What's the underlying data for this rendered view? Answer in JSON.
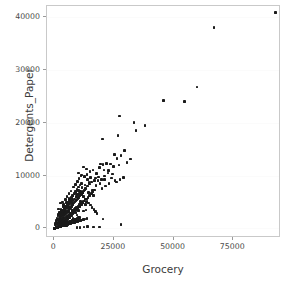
{
  "chart_data": {
    "type": "scatter",
    "title": "",
    "xlabel": "Grocery",
    "ylabel": "Detergents_Paper",
    "xlim": [
      -3000,
      95000
    ],
    "ylim": [
      -1800,
      42000
    ],
    "xticks": [
      0,
      25000,
      50000,
      75000
    ],
    "xticklabels": [
      "0",
      "25000",
      "50000",
      "75000"
    ],
    "yticks": [
      0,
      10000,
      20000,
      30000,
      40000
    ],
    "yticklabels": [
      "0",
      "10000",
      "20000",
      "30000",
      "40000"
    ],
    "grid": true,
    "legend": null,
    "marker_color": "#1a1a1a",
    "marker_size": 3,
    "n_points": 440,
    "points": [
      [
        12126,
        6707
      ],
      [
        6975,
        2919
      ],
      [
        7684,
        3516
      ],
      [
        5104,
        507
      ],
      [
        20484,
        1788
      ],
      [
        6369,
        2405
      ],
      [
        7198,
        5417
      ],
      [
        7684,
        4756
      ],
      [
        5008,
        1125
      ],
      [
        10159,
        5777
      ],
      [
        2182,
        1483
      ],
      [
        8953,
        1672
      ],
      [
        21042,
        9213
      ],
      [
        5570,
        2316
      ],
      [
        11559,
        8404
      ],
      [
        2796,
        1056
      ],
      [
        13507,
        5003
      ],
      [
        2085,
        465
      ],
      [
        13316,
        3471
      ],
      [
        3884,
        961
      ],
      [
        6157,
        5686
      ],
      [
        2483,
        371
      ],
      [
        9191,
        3055
      ],
      [
        16386,
        6210
      ],
      [
        8147,
        2906
      ],
      [
        6694,
        1000
      ],
      [
        9274,
        5963
      ],
      [
        3436,
        802
      ],
      [
        3232,
        750
      ],
      [
        3511,
        804
      ],
      [
        6207,
        3188
      ],
      [
        5047,
        1105
      ],
      [
        4396,
        3190
      ],
      [
        13178,
        4540
      ],
      [
        27329,
        21228
      ],
      [
        4948,
        1330
      ],
      [
        4318,
        640
      ],
      [
        6886,
        1345
      ],
      [
        10266,
        1567
      ],
      [
        3802,
        1130
      ],
      [
        2085,
        582
      ],
      [
        10072,
        3394
      ],
      [
        5256,
        1708
      ],
      [
        11011,
        5100
      ],
      [
        5613,
        1426
      ],
      [
        7812,
        1852
      ],
      [
        12352,
        3266
      ],
      [
        7684,
        3516
      ],
      [
        3042,
        696
      ],
      [
        5234,
        2140
      ],
      [
        9602,
        2550
      ],
      [
        5000,
        1300
      ],
      [
        6000,
        2300
      ],
      [
        4200,
        1500
      ],
      [
        7500,
        2900
      ],
      [
        3300,
        900
      ],
      [
        2400,
        600
      ],
      [
        8800,
        3800
      ],
      [
        5600,
        1900
      ],
      [
        10500,
        4600
      ],
      [
        12000,
        5200
      ],
      [
        14500,
        6800
      ],
      [
        9000,
        3500
      ],
      [
        6400,
        2200
      ],
      [
        4700,
        1400
      ],
      [
        3100,
        700
      ],
      [
        2200,
        480
      ],
      [
        1800,
        320
      ],
      [
        1500,
        260
      ],
      [
        1200,
        180
      ],
      [
        16000,
        7200
      ],
      [
        17500,
        8100
      ],
      [
        13200,
        5600
      ],
      [
        11800,
        4900
      ],
      [
        8400,
        3100
      ],
      [
        7100,
        2600
      ],
      [
        5900,
        2000
      ],
      [
        4500,
        1250
      ],
      [
        3600,
        880
      ],
      [
        2900,
        620
      ],
      [
        19500,
        12200
      ],
      [
        20500,
        12100
      ],
      [
        18900,
        11500
      ],
      [
        22000,
        12300
      ],
      [
        23500,
        12200
      ],
      [
        24800,
        11700
      ],
      [
        26300,
        13200
      ],
      [
        27100,
        12000
      ],
      [
        25200,
        14000
      ],
      [
        28000,
        13800
      ],
      [
        29500,
        14700
      ],
      [
        26800,
        17600
      ],
      [
        20200,
        16900
      ],
      [
        33500,
        20000
      ],
      [
        34200,
        18500
      ],
      [
        38000,
        19400
      ],
      [
        30500,
        12500
      ],
      [
        32000,
        13100
      ],
      [
        45800,
        24200
      ],
      [
        54500,
        24000
      ],
      [
        59800,
        26700
      ],
      [
        67000,
        37900
      ],
      [
        92780,
        40827
      ],
      [
        28000,
        800
      ],
      [
        19000,
        250
      ],
      [
        16500,
        300
      ],
      [
        14000,
        350
      ],
      [
        12500,
        260
      ],
      [
        10800,
        200
      ],
      [
        9500,
        180
      ],
      [
        1100,
        150
      ],
      [
        900,
        120
      ],
      [
        750,
        95
      ],
      [
        600,
        80
      ],
      [
        450,
        60
      ],
      [
        350,
        45
      ],
      [
        280,
        35
      ],
      [
        220,
        28
      ],
      [
        170,
        22
      ],
      [
        130,
        18
      ],
      [
        2600,
        4800
      ],
      [
        1900,
        3700
      ],
      [
        3400,
        5000
      ],
      [
        2000,
        450
      ],
      [
        2700,
        560
      ],
      [
        3900,
        1020
      ],
      [
        4400,
        1180
      ],
      [
        5100,
        1480
      ],
      [
        5800,
        1760
      ],
      [
        6500,
        2050
      ],
      [
        7200,
        2400
      ],
      [
        7900,
        2750
      ],
      [
        8600,
        3100
      ],
      [
        9300,
        3450
      ],
      [
        10000,
        3800
      ],
      [
        10700,
        4150
      ],
      [
        11400,
        4500
      ],
      [
        12100,
        4850
      ],
      [
        12800,
        5200
      ],
      [
        13500,
        5550
      ],
      [
        14200,
        5900
      ],
      [
        14900,
        6250
      ],
      [
        15600,
        6600
      ],
      [
        16300,
        6950
      ],
      [
        17000,
        7300
      ],
      [
        1000,
        200
      ],
      [
        1400,
        280
      ],
      [
        1700,
        340
      ],
      [
        2100,
        420
      ],
      [
        2500,
        500
      ],
      [
        2800,
        560
      ],
      [
        3200,
        640
      ],
      [
        3500,
        700
      ],
      [
        3800,
        760
      ],
      [
        4100,
        820
      ],
      [
        4600,
        920
      ],
      [
        4900,
        980
      ],
      [
        5300,
        1060
      ],
      [
        5700,
        1140
      ],
      [
        6100,
        1220
      ],
      [
        6600,
        1320
      ],
      [
        7000,
        1400
      ],
      [
        7400,
        1480
      ],
      [
        7800,
        1560
      ],
      [
        8200,
        1640
      ],
      [
        8700,
        1740
      ],
      [
        9100,
        1820
      ],
      [
        9600,
        1920
      ],
      [
        10100,
        2020
      ],
      [
        10600,
        2120
      ],
      [
        500,
        70
      ],
      [
        700,
        100
      ],
      [
        850,
        130
      ],
      [
        1050,
        160
      ],
      [
        1300,
        200
      ],
      [
        1600,
        250
      ],
      [
        1950,
        300
      ],
      [
        2300,
        360
      ],
      [
        2650,
        410
      ],
      [
        3000,
        470
      ],
      [
        3300,
        520
      ],
      [
        3700,
        580
      ],
      [
        4000,
        630
      ],
      [
        4300,
        680
      ],
      [
        4800,
        750
      ],
      [
        5200,
        820
      ],
      [
        5500,
        870
      ],
      [
        6000,
        950
      ],
      [
        6300,
        1000
      ],
      [
        6800,
        1080
      ],
      [
        300,
        40
      ],
      [
        400,
        55
      ],
      [
        550,
        75
      ],
      [
        650,
        90
      ],
      [
        800,
        110
      ],
      [
        950,
        135
      ],
      [
        1150,
        165
      ],
      [
        1350,
        190
      ],
      [
        1550,
        220
      ],
      [
        1750,
        250
      ],
      [
        2050,
        290
      ],
      [
        2250,
        320
      ],
      [
        2450,
        350
      ],
      [
        2750,
        390
      ],
      [
        3050,
        430
      ],
      [
        3350,
        470
      ],
      [
        3650,
        510
      ],
      [
        3950,
        560
      ],
      [
        4250,
        600
      ],
      [
        4550,
        640
      ],
      [
        1600,
        2400
      ],
      [
        2200,
        3000
      ],
      [
        2900,
        3600
      ],
      [
        1300,
        1800
      ],
      [
        900,
        1400
      ],
      [
        4700,
        5500
      ],
      [
        5400,
        6000
      ],
      [
        6200,
        6600
      ],
      [
        7000,
        7100
      ],
      [
        3800,
        4500
      ],
      [
        8100,
        7800
      ],
      [
        8900,
        8300
      ],
      [
        9700,
        8900
      ],
      [
        10400,
        9400
      ],
      [
        11200,
        9900
      ],
      [
        12600,
        9800
      ],
      [
        13800,
        10200
      ],
      [
        15200,
        9600
      ],
      [
        16800,
        9100
      ],
      [
        14600,
        8700
      ],
      [
        12900,
        8200
      ],
      [
        11600,
        7700
      ],
      [
        10300,
        7200
      ],
      [
        9000,
        6700
      ],
      [
        7700,
        6100
      ],
      [
        6400,
        5500
      ],
      [
        5100,
        4900
      ],
      [
        3900,
        4200
      ],
      [
        2800,
        3400
      ],
      [
        1800,
        2600
      ],
      [
        17800,
        10400
      ],
      [
        18600,
        9700
      ],
      [
        19800,
        9200
      ],
      [
        21200,
        9900
      ],
      [
        16200,
        11000
      ],
      [
        15000,
        10700
      ],
      [
        13600,
        11200
      ],
      [
        12200,
        11600
      ],
      [
        20800,
        11000
      ],
      [
        22600,
        10500
      ],
      [
        1200,
        2000
      ],
      [
        1000,
        1600
      ],
      [
        800,
        1250
      ],
      [
        620,
        950
      ],
      [
        480,
        700
      ],
      [
        2500,
        2100
      ],
      [
        3100,
        2500
      ],
      [
        3700,
        2800
      ],
      [
        4300,
        3200
      ],
      [
        4900,
        3500
      ],
      [
        5500,
        3900
      ],
      [
        6100,
        4200
      ],
      [
        6700,
        4600
      ],
      [
        7300,
        4900
      ],
      [
        7900,
        5300
      ],
      [
        8500,
        5600
      ],
      [
        9100,
        6000
      ],
      [
        9800,
        6400
      ],
      [
        10400,
        6700
      ],
      [
        11000,
        7000
      ],
      [
        11700,
        6400
      ],
      [
        12400,
        6000
      ],
      [
        13100,
        5600
      ],
      [
        13800,
        5200
      ],
      [
        14500,
        4800
      ],
      [
        15200,
        4400
      ],
      [
        15900,
        4000
      ],
      [
        16600,
        3600
      ],
      [
        17300,
        3200
      ],
      [
        18000,
        2800
      ],
      [
        2000,
        1000
      ],
      [
        2400,
        1150
      ],
      [
        2900,
        1350
      ],
      [
        3400,
        1550
      ],
      [
        3900,
        1750
      ],
      [
        4400,
        1950
      ],
      [
        4900,
        2150
      ],
      [
        5400,
        2350
      ],
      [
        5900,
        2550
      ],
      [
        6400,
        2750
      ],
      [
        6900,
        2950
      ],
      [
        7400,
        3150
      ],
      [
        7900,
        3350
      ],
      [
        8400,
        3550
      ],
      [
        8900,
        3750
      ],
      [
        9400,
        3950
      ],
      [
        9900,
        4150
      ],
      [
        10400,
        4350
      ],
      [
        10900,
        4550
      ],
      [
        11400,
        4750
      ],
      [
        250,
        30
      ],
      [
        330,
        42
      ],
      [
        420,
        58
      ],
      [
        510,
        68
      ],
      [
        590,
        82
      ],
      [
        690,
        98
      ],
      [
        780,
        115
      ],
      [
        880,
        128
      ],
      [
        980,
        145
      ],
      [
        1080,
        162
      ],
      [
        1180,
        178
      ],
      [
        1280,
        195
      ],
      [
        1380,
        212
      ],
      [
        1480,
        228
      ],
      [
        1580,
        245
      ],
      [
        1680,
        262
      ],
      [
        1780,
        278
      ],
      [
        1880,
        295
      ],
      [
        1980,
        312
      ],
      [
        2080,
        328
      ],
      [
        2180,
        345
      ],
      [
        2280,
        362
      ],
      [
        2380,
        378
      ],
      [
        2480,
        395
      ],
      [
        2580,
        412
      ],
      [
        150,
        20
      ],
      [
        190,
        25
      ],
      [
        230,
        32
      ],
      [
        270,
        38
      ],
      [
        310,
        44
      ],
      [
        360,
        50
      ],
      [
        410,
        57
      ],
      [
        460,
        64
      ],
      [
        520,
        72
      ],
      [
        580,
        80
      ],
      [
        640,
        88
      ],
      [
        700,
        96
      ],
      [
        760,
        104
      ],
      [
        820,
        112
      ],
      [
        890,
        122
      ],
      [
        960,
        132
      ],
      [
        1020,
        140
      ],
      [
        1100,
        150
      ],
      [
        1170,
        160
      ],
      [
        1240,
        170
      ],
      [
        5000,
        700
      ],
      [
        5600,
        780
      ],
      [
        6200,
        860
      ],
      [
        6800,
        940
      ],
      [
        7400,
        1020
      ],
      [
        8000,
        1100
      ],
      [
        8600,
        1180
      ],
      [
        9200,
        1260
      ],
      [
        9800,
        1340
      ],
      [
        10400,
        1420
      ],
      [
        11000,
        1500
      ],
      [
        11600,
        1580
      ],
      [
        12300,
        1670
      ],
      [
        13000,
        1760
      ],
      [
        13700,
        1850
      ],
      [
        3000,
        3000
      ],
      [
        3600,
        3400
      ],
      [
        4200,
        3800
      ],
      [
        4800,
        4200
      ],
      [
        5400,
        4600
      ],
      [
        6000,
        5000
      ],
      [
        6600,
        5400
      ],
      [
        7200,
        5800
      ],
      [
        7800,
        6200
      ],
      [
        8400,
        6600
      ],
      [
        9000,
        7000
      ],
      [
        9600,
        7400
      ],
      [
        10200,
        7800
      ],
      [
        10800,
        8200
      ],
      [
        11400,
        8600
      ],
      [
        2300,
        2000
      ],
      [
        2700,
        2300
      ],
      [
        3100,
        2600
      ],
      [
        3500,
        2900
      ],
      [
        4000,
        3300
      ],
      [
        4500,
        3700
      ],
      [
        5000,
        4000
      ],
      [
        5500,
        4400
      ],
      [
        6000,
        4700
      ],
      [
        6500,
        5100
      ],
      [
        1400,
        900
      ],
      [
        1700,
        1050
      ],
      [
        2000,
        1200
      ],
      [
        2350,
        1400
      ],
      [
        2700,
        1600
      ],
      [
        3050,
        1800
      ],
      [
        3400,
        2000
      ],
      [
        3750,
        2200
      ],
      [
        4100,
        2400
      ],
      [
        4450,
        2600
      ],
      [
        4800,
        2800
      ],
      [
        5150,
        3000
      ],
      [
        5500,
        3200
      ],
      [
        5850,
        3400
      ],
      [
        6200,
        3600
      ],
      [
        6550,
        3800
      ],
      [
        6900,
        4000
      ],
      [
        7250,
        4200
      ],
      [
        7600,
        4400
      ],
      [
        7950,
        4600
      ],
      [
        8300,
        4800
      ],
      [
        8650,
        5000
      ],
      [
        9000,
        5200
      ],
      [
        9350,
        5400
      ],
      [
        9700,
        5600
      ],
      [
        10050,
        5800
      ],
      [
        10400,
        6000
      ],
      [
        10750,
        6200
      ],
      [
        11100,
        6400
      ],
      [
        11450,
        6600
      ],
      [
        11800,
        6800
      ],
      [
        12150,
        7000
      ],
      [
        12500,
        7200
      ],
      [
        12850,
        7400
      ],
      [
        13200,
        7600
      ],
      [
        14000,
        8000
      ],
      [
        14800,
        8400
      ],
      [
        15600,
        8800
      ],
      [
        17200,
        9500
      ],
      [
        18400,
        9000
      ],
      [
        19200,
        8500
      ],
      [
        13900,
        9300
      ],
      [
        12700,
        9700
      ],
      [
        11500,
        10100
      ],
      [
        10300,
        10500
      ],
      [
        24000,
        9500
      ],
      [
        25500,
        9000
      ],
      [
        23000,
        8500
      ],
      [
        21500,
        8000
      ],
      [
        20000,
        7500
      ],
      [
        26000,
        8800
      ],
      [
        27500,
        9200
      ],
      [
        29000,
        9600
      ],
      [
        24500,
        10300
      ],
      [
        22800,
        10900
      ]
    ]
  }
}
